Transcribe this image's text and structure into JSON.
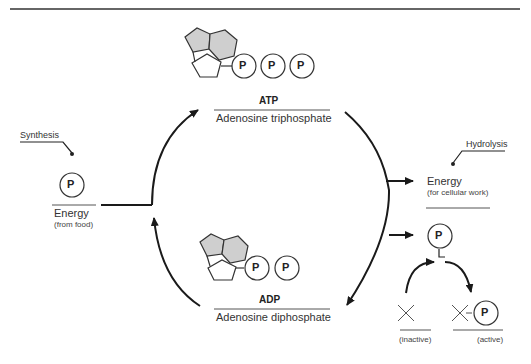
{
  "diagram": {
    "type": "cycle"
  },
  "atp": {
    "abbr": "ATP",
    "name": "Adenosine triphosphate",
    "phosphates": [
      "P",
      "P",
      "P"
    ]
  },
  "adp": {
    "abbr": "ADP",
    "name": "Adenosine diphosphate",
    "phosphates": [
      "P",
      "P"
    ]
  },
  "synthesis": {
    "label": "Synthesis",
    "input_symbol": "P",
    "energy_label": "Energy",
    "energy_source": "(from food)"
  },
  "hydrolysis": {
    "label": "Hydrolysis",
    "energy_label": "Energy",
    "energy_use": "(for cellular work)",
    "output_symbol": "P"
  },
  "phosphorylation": {
    "inactive_symbol": "X",
    "inactive_label": "(inactive)",
    "active_symbol": "X",
    "active_phosphate": "P",
    "active_label": "(active)"
  },
  "colors": {
    "line": "#1a1a1a",
    "ring_fill": "#cfcfcf",
    "ring_stroke": "#333333"
  }
}
